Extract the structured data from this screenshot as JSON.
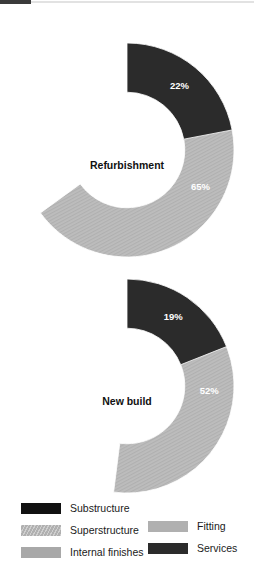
{
  "figure": {
    "background": "#ffffff",
    "top_bar_color": "#3a3a3a",
    "top_rule_color": "#e2e2e2"
  },
  "palette": {
    "substructure": "#111111",
    "superstructure": "#b7b7b7",
    "internal_finishes": "#a8a8a8",
    "fitting": "#9a9a9a",
    "services": "#2b2b2b",
    "label_text": "#ffffff",
    "center_text": "#111111"
  },
  "legend": {
    "left_column": [
      {
        "label": "Substructure",
        "color": "#111111",
        "pattern": "solid"
      },
      {
        "label": "Superstructure",
        "color": "#c2c2c2",
        "pattern": "hatch"
      },
      {
        "label": "Internal finishes",
        "color": "#a8a8a8",
        "pattern": "solid"
      }
    ],
    "right_column": [
      {
        "label": "Fitting",
        "color": "#b0b0b0",
        "pattern": "solid"
      },
      {
        "label": "Services",
        "color": "#2b2b2b",
        "pattern": "solid"
      }
    ]
  },
  "chart_data": [
    {
      "type": "pie",
      "variant": "donut",
      "title": "Refurbishment",
      "center_label": "Refurbishment",
      "start_angle_deg": 0,
      "direction": "clockwise",
      "hole_ratio": 0.54,
      "labels": [
        "Substructure",
        "Superstructure",
        "Internal finishes",
        "Fitting",
        "Services"
      ],
      "values": [
        3,
        65,
        4,
        6,
        22
      ],
      "value_labels": [
        "3%",
        "65%",
        "4%",
        "6%",
        "22%"
      ],
      "colors": [
        "#111111",
        "#b7b7b7",
        "#a8a8a8",
        "#9a9a9a",
        "#2b2b2b"
      ],
      "patterns": [
        "solid",
        "hatch",
        "solid",
        "solid",
        "solid"
      ],
      "units": "%"
    },
    {
      "type": "pie",
      "variant": "donut",
      "title": "New build",
      "center_label": "New build",
      "start_angle_deg": 0,
      "direction": "clockwise",
      "hole_ratio": 0.54,
      "labels": [
        "Substructure",
        "Superstructure",
        "Internal finishes",
        "Fitting",
        "Services"
      ],
      "values": [
        14,
        52,
        12,
        3,
        19
      ],
      "value_labels": [
        "14%",
        "52%",
        "12%",
        "3%",
        "19%"
      ],
      "colors": [
        "#111111",
        "#b7b7b7",
        "#a8a8a8",
        "#9a9a9a",
        "#2b2b2b"
      ],
      "patterns": [
        "solid",
        "hatch",
        "solid",
        "solid",
        "solid"
      ],
      "units": "%"
    }
  ]
}
